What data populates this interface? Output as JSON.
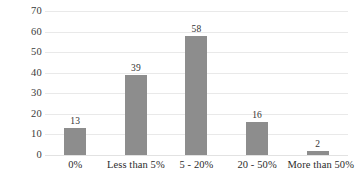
{
  "chart_data": {
    "type": "bar",
    "title": "",
    "subtitle": "",
    "xlabel": "",
    "ylabel": "",
    "categories": [
      "0%",
      "Less than 5%",
      "5 - 20%",
      "20 - 50%",
      "More than 50%"
    ],
    "values": [
      13,
      39,
      58,
      16,
      2
    ],
    "data_labels": [
      "13",
      "39",
      "58",
      "16",
      "2"
    ],
    "ylim": [
      0,
      70
    ],
    "ytick_step": 10,
    "ytick_labels": [
      "70",
      "60",
      "50",
      "40",
      "30",
      "20",
      "10",
      "0"
    ],
    "ytick_values": [
      70,
      60,
      50,
      40,
      30,
      20,
      10,
      0
    ],
    "grid": "horizontal",
    "legend": "none",
    "bar_color": "#8d8d8d",
    "gridline_color": "#e9e9e9",
    "background_color": "#ffffff",
    "text_color": "#2b2b2b"
  }
}
